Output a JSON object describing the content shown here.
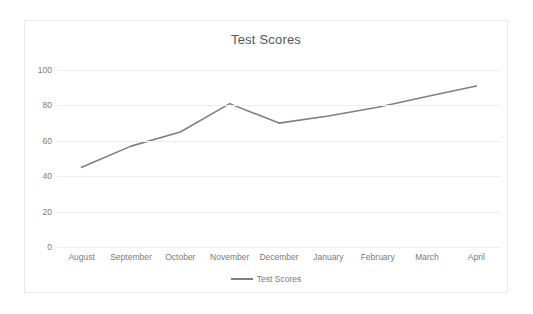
{
  "chart_data": {
    "type": "line",
    "title": "Test Scores",
    "xlabel": "",
    "ylabel": "",
    "categories": [
      "August",
      "September",
      "October",
      "November",
      "December",
      "January",
      "February",
      "March",
      "April"
    ],
    "series": [
      {
        "name": "Test Scores",
        "values": [
          45,
          57,
          65,
          81,
          70,
          74,
          79,
          85,
          91
        ],
        "color": "#808080"
      }
    ],
    "ylim": [
      0,
      100
    ],
    "yticks": [
      0,
      20,
      40,
      60,
      80,
      100
    ],
    "ytick_labels": [
      "0",
      "20",
      "40",
      "60",
      "80",
      "100"
    ],
    "grid": true,
    "grid_color": "#eeeeee",
    "legend": {
      "position": "bottom",
      "entries": [
        "Test Scores"
      ]
    },
    "plot_background": "#ffffff",
    "border_color": "#e9e9e9",
    "text_color": "#7b7b7b",
    "title_color": "#575757"
  }
}
